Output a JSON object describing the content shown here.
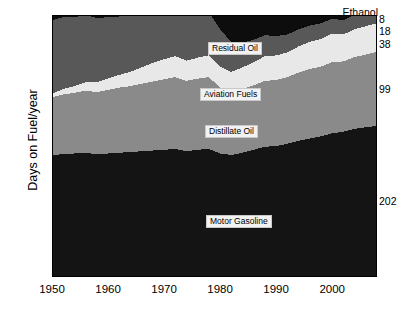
{
  "chart_data": {
    "type": "area",
    "title": "",
    "xlabel": "",
    "ylabel": "Days on Fuel/year",
    "stacked": true,
    "grid": false,
    "legend_position": "inline-annotations",
    "xlim": [
      1950,
      2008
    ],
    "ylim": [
      0,
      350
    ],
    "ytick_labels": [
      "0",
      "50",
      "100",
      "150",
      "200",
      "250",
      "300",
      "350"
    ],
    "ytick_values": [
      0,
      50,
      100,
      150,
      200,
      250,
      300,
      350
    ],
    "xtick_labels": [
      "1950",
      "1960",
      "1970",
      "1980",
      "1990",
      "2000"
    ],
    "xtick_values": [
      1950,
      1960,
      1970,
      1980,
      1990,
      2000
    ],
    "x": [
      1950,
      1952,
      1954,
      1956,
      1958,
      1960,
      1962,
      1964,
      1966,
      1968,
      1970,
      1972,
      1974,
      1976,
      1978,
      1980,
      1982,
      1984,
      1986,
      1988,
      1990,
      1992,
      1994,
      1996,
      1998,
      2000,
      2002,
      2004,
      2006,
      2008
    ],
    "series": [
      {
        "name": "Motor Gasoline",
        "color": "#141414",
        "end_value": 202,
        "values": [
          163,
          164,
          165,
          166,
          164,
          165,
          166,
          167,
          168,
          169,
          170,
          171,
          168,
          170,
          171,
          165,
          163,
          166,
          170,
          174,
          175,
          178,
          182,
          185,
          188,
          192,
          194,
          198,
          200,
          202
        ]
      },
      {
        "name": "Distillate Oil",
        "color": "#8a8a8a",
        "end_value": 99,
        "values": [
          77,
          80,
          81,
          83,
          83,
          85,
          87,
          88,
          90,
          92,
          94,
          96,
          94,
          95,
          96,
          88,
          84,
          85,
          86,
          88,
          88,
          89,
          91,
          93,
          93,
          95,
          94,
          96,
          97,
          99
        ]
      },
      {
        "name": "Aviation Fuels",
        "color": "#e8e8e8",
        "end_value": 38,
        "values": [
          5,
          7,
          9,
          11,
          13,
          15,
          17,
          19,
          22,
          25,
          27,
          28,
          27,
          28,
          29,
          28,
          27,
          29,
          31,
          33,
          33,
          33,
          35,
          36,
          37,
          38,
          36,
          37,
          38,
          38
        ]
      },
      {
        "name": "Residual Oil",
        "color": "#585858",
        "end_value": 18,
        "values": [
          98,
          96,
          92,
          90,
          86,
          82,
          78,
          75,
          72,
          70,
          68,
          66,
          64,
          62,
          58,
          50,
          40,
          33,
          30,
          28,
          26,
          24,
          23,
          22,
          21,
          20,
          19,
          19,
          18,
          18
        ]
      },
      {
        "name": "Ethanol",
        "color": "#0a0a0a",
        "end_value": 8,
        "values": [
          0,
          0,
          0,
          0,
          0,
          0,
          0,
          0,
          0,
          0,
          0,
          0,
          0,
          0,
          0,
          1,
          1,
          1,
          1,
          1,
          1,
          1,
          1,
          2,
          2,
          2,
          3,
          4,
          6,
          8
        ]
      }
    ],
    "annotations": [
      {
        "name": "Ethanol",
        "label": "Ethanol",
        "kind": "outside-top-right"
      },
      {
        "name": "Residual Oil",
        "label": "Residual Oil",
        "kind": "inline-box"
      },
      {
        "name": "Aviation Fuels",
        "label": "Aviation Fuels",
        "kind": "inline-box"
      },
      {
        "name": "Distillate Oil",
        "label": "Distillate Oil",
        "kind": "inline-box"
      },
      {
        "name": "Motor Gasoline",
        "label": "Motor Gasoline",
        "kind": "inline-box"
      }
    ]
  }
}
